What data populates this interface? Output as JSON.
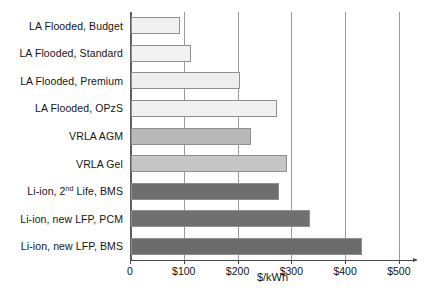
{
  "chart_data": {
    "type": "bar",
    "orientation": "horizontal",
    "title": "",
    "xlabel": "$/kWh",
    "ylabel": "",
    "xlim": [
      0,
      530
    ],
    "xticks": [
      0,
      100,
      200,
      300,
      400,
      500
    ],
    "xtick_labels": [
      "0",
      "$100",
      "$200",
      "$300",
      "$400",
      "$500"
    ],
    "grid": "vertical",
    "legend": "none",
    "categories": [
      "LA Flooded, Budget",
      "LA Flooded, Standard",
      "LA Flooded, Premium",
      "LA Flooded, OPzS",
      "VRLA AGM",
      "VRLA Gel",
      "Li-ion, 2nd Life, BMS",
      "Li-ion, new LFP, PCM",
      "Li-ion, new LFP, BMS"
    ],
    "values": [
      92,
      112,
      203,
      272,
      223,
      290,
      275,
      333,
      430
    ],
    "bar_colors": [
      "#f0f0f0",
      "#f2f2f2",
      "#eeeeee",
      "#f1f1f1",
      "#b9b9b9",
      "#c6c6c6",
      "#6e6e6e",
      "#707070",
      "#6c6c6c"
    ]
  },
  "categories_display": [
    {
      "pre": "LA Flooded, Budget",
      "sup": "",
      "post": ""
    },
    {
      "pre": "LA Flooded, Standard",
      "sup": "",
      "post": ""
    },
    {
      "pre": "LA Flooded, Premium",
      "sup": "",
      "post": ""
    },
    {
      "pre": "LA Flooded, OPzS",
      "sup": "",
      "post": ""
    },
    {
      "pre": "VRLA AGM",
      "sup": "",
      "post": ""
    },
    {
      "pre": "VRLA Gel",
      "sup": "",
      "post": ""
    },
    {
      "pre": "Li-ion, 2",
      "sup": "nd",
      "post": " Life, BMS"
    },
    {
      "pre": "Li-ion, new LFP, PCM",
      "sup": "",
      "post": ""
    },
    {
      "pre": "Li-ion, new LFP, BMS",
      "sup": "",
      "post": ""
    }
  ]
}
